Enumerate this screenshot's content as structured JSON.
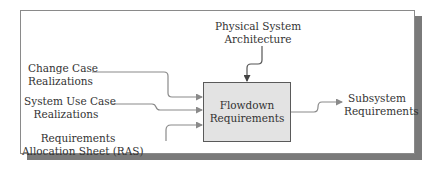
{
  "diagram": {
    "process": {
      "line1": "Flowdown",
      "line2": "Requirements"
    },
    "inputs": [
      {
        "line1": "Change Case",
        "line2": "Realizations"
      },
      {
        "line1": "System Use Case",
        "line2": "Realizations"
      },
      {
        "line1": "Requirements",
        "line2": "Allocation Sheet (RAS)"
      }
    ],
    "control": {
      "line1": "Physical System",
      "line2": "Architecture"
    },
    "output": {
      "line1": "Subsystem",
      "line2": "Requirements"
    },
    "colors": {
      "box_fill": "#e3e3e3",
      "line": "#8a8a8a",
      "shadow": "#7a7a7a",
      "text": "#333333"
    }
  }
}
